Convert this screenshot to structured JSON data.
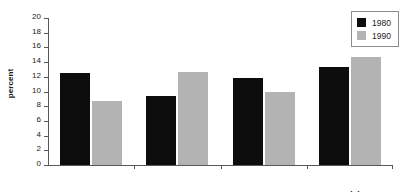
{
  "chart_data": {
    "type": "bar",
    "title": "",
    "xlabel": "",
    "ylabel": "percent",
    "categories": [
      "Egypt",
      "Iran",
      "Morocco",
      "Tunisia"
    ],
    "series": [
      {
        "name": "1980",
        "color": "#0d0d0d",
        "values": [
          12.5,
          9.4,
          11.9,
          13.4
        ]
      },
      {
        "name": "1990",
        "color": "#b3b3b3",
        "values": [
          8.7,
          12.6,
          10.0,
          14.7
        ]
      }
    ],
    "ylim": [
      0,
      20
    ],
    "ytick_step": 2,
    "yticks": [
      "20",
      "18",
      "16",
      "14",
      "12",
      "10",
      "8",
      "6",
      "4",
      "2",
      "0"
    ],
    "grid": false,
    "legend_position": "top-right"
  },
  "legend": {
    "entries": [
      {
        "label": "1980"
      },
      {
        "label": "1990"
      }
    ]
  },
  "axes": {
    "y_title": "percent"
  }
}
